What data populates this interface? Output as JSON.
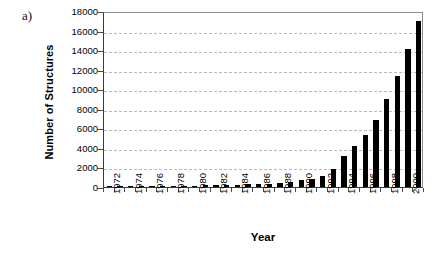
{
  "figure": {
    "panel_label": "a)"
  },
  "chart_data": {
    "type": "bar",
    "title": "",
    "xlabel": "Year",
    "ylabel": "Number of Structures",
    "ylim": [
      0,
      18000
    ],
    "ytick_step": 2000,
    "ytick_labels": [
      "0",
      "2000",
      "4000",
      "6000",
      "8000",
      "10000",
      "12000",
      "14000",
      "16000",
      "18000"
    ],
    "ytick_values": [
      0,
      2000,
      4000,
      6000,
      8000,
      10000,
      12000,
      14000,
      16000,
      18000
    ],
    "grid": true,
    "grid_axis": "y",
    "legend": false,
    "bar_color": "#000000",
    "xtick_label_rotation": -90,
    "xtick_labels": [
      "1972",
      "1974",
      "1976",
      "1978",
      "1980",
      "1982",
      "1984",
      "1986",
      "1988",
      "1990",
      "1992",
      "1994",
      "1996",
      "1998",
      "2000"
    ],
    "xtick_label_interval": 2,
    "categories": [
      "1972",
      "1973",
      "1974",
      "1975",
      "1976",
      "1977",
      "1978",
      "1979",
      "1980",
      "1981",
      "1982",
      "1983",
      "1984",
      "1985",
      "1986",
      "1987",
      "1988",
      "1989",
      "1990",
      "1991",
      "1992",
      "1993",
      "1994",
      "1995",
      "1996",
      "1997",
      "1998",
      "1999",
      "2000",
      "2001"
    ],
    "values": [
      10,
      15,
      20,
      30,
      60,
      70,
      100,
      120,
      140,
      160,
      200,
      220,
      250,
      260,
      280,
      330,
      420,
      520,
      680,
      860,
      1080,
      1800,
      3200,
      4150,
      5350,
      6900,
      9000,
      11400,
      14100,
      17000
    ]
  }
}
